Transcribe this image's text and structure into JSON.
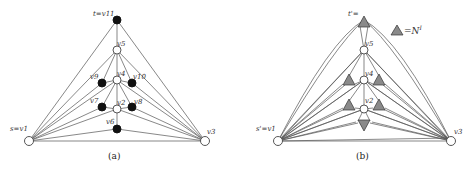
{
  "figure": {
    "panel_a": {
      "caption": "(a)",
      "labels": {
        "top": "t=v11",
        "v5": "v5",
        "v4": "v4",
        "v9": "v9",
        "v10": "v10",
        "v7": "v7",
        "v2": "v2",
        "v8": "v8",
        "v6": "v6",
        "left": "s=v1",
        "right": "v3"
      },
      "nodes": [
        {
          "id": "v11",
          "x": 117,
          "y": 20,
          "fill": "black"
        },
        {
          "id": "v5",
          "x": 117,
          "y": 50,
          "fill": "white"
        },
        {
          "id": "v4",
          "x": 117,
          "y": 80,
          "fill": "white"
        },
        {
          "id": "v9",
          "x": 102,
          "y": 83,
          "fill": "black"
        },
        {
          "id": "v10",
          "x": 132,
          "y": 83,
          "fill": "black"
        },
        {
          "id": "v7",
          "x": 102,
          "y": 107,
          "fill": "black"
        },
        {
          "id": "v2",
          "x": 117,
          "y": 109,
          "fill": "white"
        },
        {
          "id": "v8",
          "x": 132,
          "y": 107,
          "fill": "black"
        },
        {
          "id": "v6",
          "x": 117,
          "y": 129,
          "fill": "black"
        },
        {
          "id": "v1",
          "x": 29,
          "y": 141,
          "fill": "white"
        },
        {
          "id": "v3",
          "x": 205,
          "y": 141,
          "fill": "white"
        }
      ]
    },
    "panel_b": {
      "caption": "(b)",
      "legend": "=N",
      "legend_sup": "I",
      "labels": {
        "top": "t'=",
        "v5": "v5",
        "v4": "v4",
        "v2": "v2",
        "left": "s'=v1",
        "right": "v3",
        "io": "I"
      },
      "colors": {
        "gadget_fill": "#8a8a8a"
      }
    }
  }
}
